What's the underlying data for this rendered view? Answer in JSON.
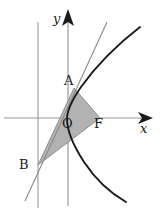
{
  "figure": {
    "width": 165,
    "height": 214,
    "background_color": "#ffffff"
  },
  "axes": {
    "x_axis": {
      "label": "x",
      "name": "x-axis",
      "y_pixel": 118,
      "x_start": 4,
      "x_end": 152,
      "color": "#9a9a9a",
      "has_arrow": true
    },
    "y_axis": {
      "label": "y",
      "name": "y-axis",
      "x_pixel": 68,
      "y_start": 206,
      "y_end": 10,
      "color": "#9a9a9a",
      "has_arrow": true
    },
    "directrix": {
      "label": "",
      "name": "directrix",
      "x_pixel": 38,
      "y_start": 22,
      "y_end": 208,
      "color": "#9a9a9a",
      "has_arrow": false
    }
  },
  "points": [
    {
      "id": "A",
      "label": "A",
      "x": 74,
      "y": 88,
      "label_x": 64,
      "label_y": 74
    },
    {
      "id": "B",
      "label": "B",
      "x": 38,
      "y": 165,
      "label_x": 19,
      "label_y": 158
    },
    {
      "id": "O",
      "label": "O",
      "x": 68,
      "y": 118,
      "label_x": 62,
      "label_y": 117
    },
    {
      "id": "F",
      "label": "F",
      "x": 100,
      "y": 118,
      "label_x": 94,
      "label_y": 117
    }
  ],
  "curves": {
    "parabola": {
      "name": "parabola-curve",
      "description": "Rightward-opening parabola, vertex near origin",
      "color": "#1a1a1a",
      "stroke_width": 1.9,
      "path": "M 140,27 C 118,44 96,66 81,87 C 72,100 67,110 67,119 C 67,130 73,145 84,162 C 96,180 112,194 126,202"
    },
    "tangent_line": {
      "name": "tangent-line",
      "description": "Tangent to the parabola at A, passing through B on the directrix",
      "color": "#8a8a8a",
      "stroke_width": 1.1,
      "x1": 25,
      "y1": 201,
      "x2": 107,
      "y2": 22
    }
  },
  "shaded_region": {
    "name": "triangle-ABF",
    "description": "Shaded triangle with vertices A, B and F",
    "fill_color": "#b2b2b2",
    "fill_opacity": 1,
    "stroke_color": "#8f8f8f",
    "stroke_width": 1,
    "vertices": "74,88 38,165 100,118"
  },
  "colors": {
    "axis_gray": "#9a9a9a",
    "curve_black": "#1a1a1a",
    "shade_gray": "#b2b2b2",
    "tangent_gray": "#8a8a8a",
    "label_black": "#1a1a1a"
  }
}
